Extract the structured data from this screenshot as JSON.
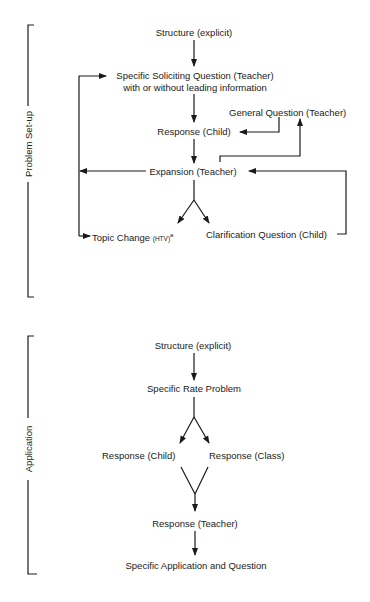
{
  "sections": {
    "problem_setup": {
      "label": "Problem Set-up",
      "nodes": {
        "structure": "Structure (explicit)",
        "soliciting_line1": "Specific Soliciting Question (Teacher)",
        "soliciting_line2": "with or without leading information",
        "general_question": "General Question (Teacher)",
        "response_child": "Response (Child)",
        "expansion": "Expansion (Teacher)",
        "topic_change": "Topic Change",
        "topic_change_abbrev": "(HTV)",
        "topic_change_footnote": "a",
        "clarification": "Clarification Question (Child)"
      }
    },
    "application": {
      "label": "Application",
      "nodes": {
        "structure": "Structure (explicit)",
        "rate_problem": "Specific Rate Problem",
        "response_child": "Response (Child)",
        "response_class": "Response (Class)",
        "response_teacher": "Response (Teacher)",
        "specific_application": "Specific Application and Question"
      }
    }
  },
  "colors": {
    "ink": "#1a1a1a",
    "background": "#ffffff"
  }
}
